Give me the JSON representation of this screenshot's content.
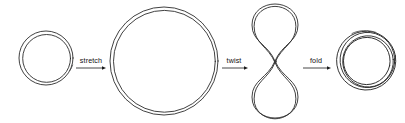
{
  "diagram": {
    "background_color": "#ffffff",
    "stroke_color": "#2b2b2b",
    "label_color": "#111111",
    "stages": [
      {
        "id": "small-loop",
        "name": "small-loop",
        "shape": "double-circle",
        "cx": 46,
        "cy": 58,
        "r": 27,
        "gap": 3.0,
        "strands": 2
      },
      {
        "id": "large-loop",
        "name": "large-loop",
        "shape": "double-circle",
        "cx": 164,
        "cy": 60,
        "r": 54,
        "gap": 3.2,
        "strands": 2
      },
      {
        "id": "figure-eight",
        "name": "figure-eight-loop",
        "shape": "lemniscate",
        "cx": 275,
        "cy": 61,
        "lobe_rx": 23,
        "lobe_ry": 28,
        "gap": 2.2,
        "strands": 2
      },
      {
        "id": "folded-loop",
        "name": "folded-coiled-loop",
        "shape": "multi-circle",
        "cx": 367,
        "cy": 60,
        "r": 30,
        "gap": 2.6,
        "strands": 4
      }
    ],
    "transitions": [
      {
        "id": "stretch",
        "label": "stretch",
        "from": "small-loop",
        "to": "large-loop",
        "arrow_x1": 76,
        "arrow_x2": 106,
        "arrow_y": 68,
        "label_x": 91,
        "label_y": 63
      },
      {
        "id": "twist",
        "label": "twist",
        "from": "large-loop",
        "to": "figure-eight",
        "arrow_x1": 222,
        "arrow_x2": 248,
        "arrow_y": 68,
        "label_x": 234,
        "label_y": 63
      },
      {
        "id": "fold",
        "label": "fold",
        "from": "figure-eight",
        "to": "folded-loop",
        "arrow_x1": 303,
        "arrow_x2": 331,
        "arrow_y": 68,
        "label_x": 316,
        "label_y": 63
      }
    ]
  }
}
